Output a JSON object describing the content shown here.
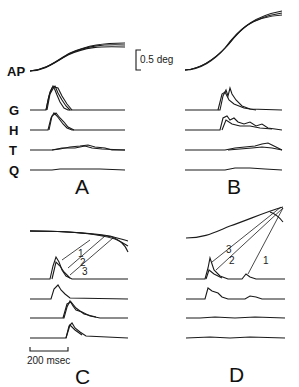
{
  "figure": {
    "row_labels": {
      "ap": "AP",
      "g": "G",
      "h": "H",
      "t": "T",
      "q": "Q"
    },
    "panels": [
      {
        "id": "A",
        "label": "A"
      },
      {
        "id": "B",
        "label": "B"
      },
      {
        "id": "C",
        "label": "C"
      },
      {
        "id": "D",
        "label": "D"
      }
    ],
    "scale_bars": {
      "vertical": "0.5 deg",
      "horizontal": "200 msec"
    },
    "annotations": {
      "C": [
        "1",
        "2",
        "3"
      ],
      "D": [
        "3",
        "2",
        "1"
      ]
    },
    "colors": {
      "trace": "#1a1a1a",
      "background": "#ffffff"
    }
  }
}
